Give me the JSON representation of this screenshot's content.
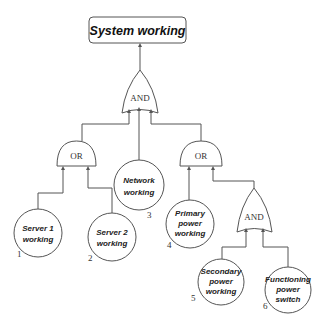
{
  "diagram": {
    "type": "success-tree",
    "top_event": {
      "label": "System working"
    },
    "gates": [
      {
        "id": "g_top",
        "label": "AND",
        "inputs": [
          "g_or1",
          "e3",
          "g_or2"
        ],
        "output": "top_event"
      },
      {
        "id": "g_or1",
        "label": "OR",
        "inputs": [
          "e1",
          "e2"
        ],
        "output": "g_top"
      },
      {
        "id": "g_or2",
        "label": "OR",
        "inputs": [
          "e4",
          "g_and2"
        ],
        "output": "g_top"
      },
      {
        "id": "g_and2",
        "label": "AND",
        "inputs": [
          "e5",
          "e6"
        ],
        "output": "g_or2"
      }
    ],
    "events": [
      {
        "id": "e1",
        "number": "1",
        "line1": "Server 1",
        "line2": "working",
        "line3": ""
      },
      {
        "id": "e2",
        "number": "2",
        "line1": "Server 2",
        "line2": "working",
        "line3": ""
      },
      {
        "id": "e3",
        "number": "3",
        "line1": "Network",
        "line2": "working",
        "line3": ""
      },
      {
        "id": "e4",
        "number": "4",
        "line1": "Primary",
        "line2": "power",
        "line3": "working"
      },
      {
        "id": "e5",
        "number": "5",
        "line1": "Secondary",
        "line2": "power",
        "line3": "working"
      },
      {
        "id": "e6",
        "number": "6",
        "line1": "Functioning",
        "line2": "power",
        "line3": "switch"
      }
    ],
    "colors": {
      "line": "#555555",
      "text": "#222222",
      "background": "#ffffff"
    }
  }
}
